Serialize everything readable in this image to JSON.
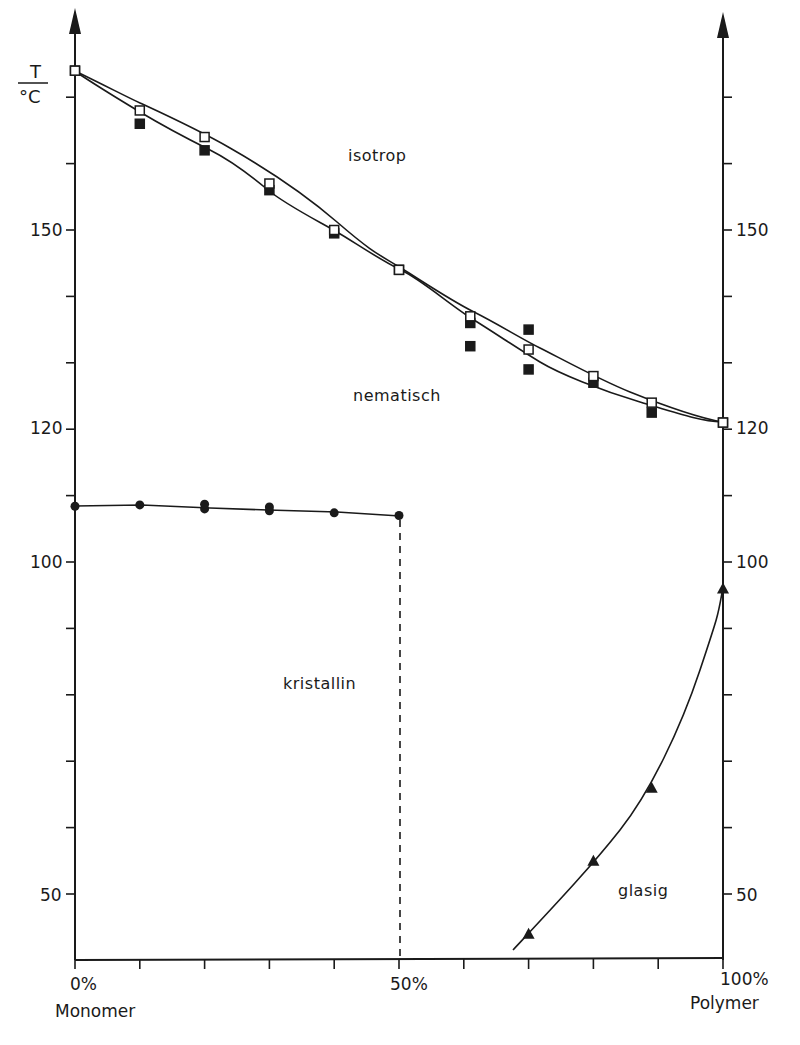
{
  "chart_data": {
    "type": "line",
    "title": "",
    "xlabel": "",
    "ylabel": "T / °C",
    "x_axis": {
      "min": 0,
      "max": 100,
      "unit": "%",
      "tick_step": 10,
      "left_label": {
        "value": "0%",
        "caption": "Monomer"
      },
      "mid_label": {
        "value": "50%"
      },
      "right_label": {
        "value": "100%",
        "caption": "Polymer"
      }
    },
    "y_axis": {
      "min": 40,
      "max": 175,
      "tick_step": 10,
      "labeled_ticks": [
        150,
        120,
        100,
        50
      ],
      "left_and_right_axes": true,
      "unit_label_top": "T",
      "unit_label_bottom": "°C"
    },
    "grid": false,
    "legend": null,
    "regions": [
      {
        "label": "isotrop",
        "x": 45,
        "y": 161
      },
      {
        "label": "nematisch",
        "x": 50,
        "y": 124
      },
      {
        "label": "kristallin",
        "x": 40,
        "y": 85
      },
      {
        "label": "glasig",
        "x": 86,
        "y": 50
      }
    ],
    "series": [
      {
        "name": "clearing point (heating, open squares)",
        "marker": "open-square",
        "points": [
          [
            0,
            174
          ],
          [
            10,
            168
          ],
          [
            20,
            164
          ],
          [
            30,
            157
          ],
          [
            40,
            150
          ],
          [
            50,
            144
          ],
          [
            61,
            137
          ],
          [
            70,
            132
          ],
          [
            80,
            128
          ],
          [
            89,
            124
          ],
          [
            100,
            121
          ]
        ]
      },
      {
        "name": "clearing point (cooling, filled squares)",
        "marker": "filled-square",
        "points": [
          [
            0,
            174
          ],
          [
            10,
            166
          ],
          [
            20,
            162
          ],
          [
            30,
            156
          ],
          [
            40,
            149.5
          ],
          [
            50,
            144
          ],
          [
            61,
            136
          ],
          [
            61,
            132.5
          ],
          [
            70,
            135
          ],
          [
            70,
            129
          ],
          [
            80,
            127
          ],
          [
            89,
            122.5
          ],
          [
            100,
            121
          ]
        ]
      },
      {
        "name": "melting point (crystalline → nematic)",
        "marker": "filled-circle",
        "points": [
          [
            0,
            108.4
          ],
          [
            10,
            108.6
          ],
          [
            20,
            108
          ],
          [
            20,
            108.7
          ],
          [
            30,
            107.7
          ],
          [
            30,
            108.3
          ],
          [
            40,
            107.4
          ],
          [
            50,
            107
          ]
        ]
      },
      {
        "name": "glass transition",
        "marker": "filled-triangle",
        "points": [
          [
            70,
            44
          ],
          [
            80,
            55
          ],
          [
            89,
            66
          ],
          [
            100,
            96
          ]
        ]
      }
    ],
    "annotations": [
      {
        "type": "dashed-vertical-line",
        "x": 50,
        "from_y": 40,
        "to_y": 107
      }
    ]
  },
  "labels": {
    "y_unit_top": "T",
    "y_unit_bottom": "°C",
    "y_left": [
      "150",
      "120",
      "100",
      "50"
    ],
    "y_right": [
      "150",
      "120",
      "100",
      "50"
    ],
    "x_left_value": "0%",
    "x_left_caption": "Monomer",
    "x_mid_value": "50%",
    "x_right_value": "100%",
    "x_right_caption": "Polymer",
    "region_isotrop": "isotrop",
    "region_nematisch": "nematisch",
    "region_kristallin": "kristallin",
    "region_glasig": "glasig"
  }
}
